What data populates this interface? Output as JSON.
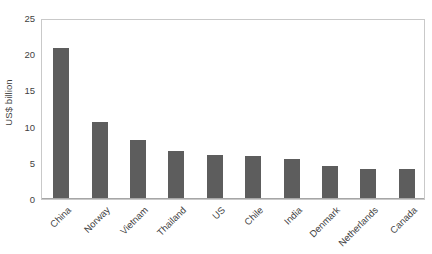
{
  "chart_data": {
    "type": "bar",
    "title": "",
    "xlabel": "",
    "ylabel": "US$ billion",
    "ylim": [
      0,
      25
    ],
    "ytick_labels": [
      "25",
      "20",
      "15",
      "10",
      "5",
      "0"
    ],
    "yticks": [
      25,
      20,
      15,
      10,
      5,
      0
    ],
    "grid": false,
    "legend": "none",
    "bar_color": "#5d5d5d",
    "categories": [
      "China",
      "Norway",
      "Vietnam",
      "Thailand",
      "US",
      "Chile",
      "India",
      "Denmark",
      "Netherlands",
      "Canada"
    ],
    "values": [
      20.9,
      10.7,
      8.1,
      6.6,
      6.1,
      5.9,
      5.5,
      4.5,
      4.2,
      4.1
    ]
  },
  "axes": {
    "plot_border_color": "#c9c9c9",
    "baseline_color": "#a6a6a6"
  }
}
